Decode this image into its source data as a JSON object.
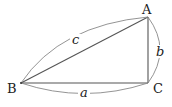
{
  "diagram": {
    "type": "right-triangle",
    "vertices": {
      "A": {
        "label": "A",
        "x": 148,
        "y": 17
      },
      "B": {
        "label": "B",
        "x": 21,
        "y": 83
      },
      "C": {
        "label": "C",
        "x": 148,
        "y": 83
      }
    },
    "sides": {
      "a": {
        "label": "a",
        "from": "B",
        "to": "C"
      },
      "b": {
        "label": "b",
        "from": "C",
        "to": "A"
      },
      "c": {
        "label": "c",
        "from": "B",
        "to": "A"
      }
    },
    "colors": {
      "line": "#555555",
      "arc": "#777777",
      "text": "#222222"
    }
  }
}
